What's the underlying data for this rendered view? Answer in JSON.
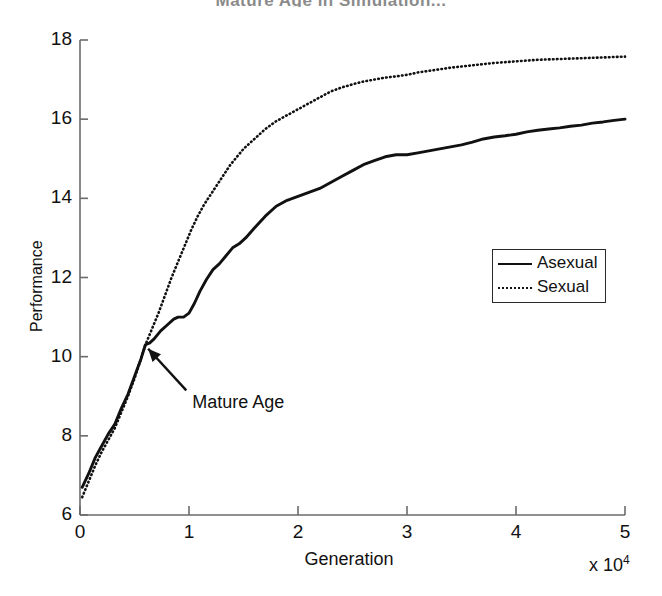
{
  "chart_data": {
    "type": "line",
    "title": "Mature Age in Simulation...",
    "xlabel": "Generation",
    "ylabel": "Performance",
    "x_multiplier": "x 10",
    "x_multiplier_exp": "4",
    "xlim": [
      0,
      5
    ],
    "ylim": [
      6,
      18
    ],
    "xticks": [
      0,
      1,
      2,
      3,
      4,
      5
    ],
    "yticks": [
      6,
      8,
      10,
      12,
      14,
      16,
      18
    ],
    "xtick_labels": [
      "0",
      "1",
      "2",
      "3",
      "4",
      "5"
    ],
    "ytick_labels": [
      "6",
      "8",
      "10",
      "12",
      "14",
      "16",
      "18"
    ],
    "grid": false,
    "legend_position": "center-right",
    "annotations": [
      {
        "text": "Mature Age",
        "point_x": 0.625,
        "point_y": 10.3,
        "label_x": 0.92,
        "label_y": 9.3
      }
    ],
    "series": [
      {
        "name": "Asexual",
        "style": "solid",
        "color": "#111111",
        "x": [
          0.02,
          0.08,
          0.14,
          0.2,
          0.26,
          0.32,
          0.38,
          0.44,
          0.5,
          0.56,
          0.6,
          0.64,
          0.68,
          0.74,
          0.8,
          0.86,
          0.9,
          0.95,
          1.0,
          1.05,
          1.1,
          1.16,
          1.22,
          1.28,
          1.34,
          1.4,
          1.46,
          1.52,
          1.6,
          1.7,
          1.8,
          1.9,
          2.0,
          2.1,
          2.2,
          2.3,
          2.4,
          2.5,
          2.6,
          2.7,
          2.8,
          2.9,
          3.0,
          3.1,
          3.2,
          3.3,
          3.4,
          3.5,
          3.6,
          3.7,
          3.8,
          3.9,
          4.0,
          4.1,
          4.2,
          4.3,
          4.4,
          4.5,
          4.6,
          4.7,
          4.8,
          4.9,
          5.0
        ],
        "y": [
          6.7,
          7.05,
          7.45,
          7.75,
          8.05,
          8.3,
          8.7,
          9.05,
          9.5,
          9.95,
          10.3,
          10.35,
          10.45,
          10.65,
          10.8,
          10.95,
          11.0,
          11.0,
          11.1,
          11.35,
          11.65,
          11.95,
          12.2,
          12.35,
          12.55,
          12.75,
          12.85,
          13.0,
          13.25,
          13.55,
          13.8,
          13.95,
          14.05,
          14.15,
          14.25,
          14.4,
          14.55,
          14.7,
          14.85,
          14.95,
          15.05,
          15.1,
          15.1,
          15.15,
          15.2,
          15.25,
          15.3,
          15.35,
          15.42,
          15.5,
          15.55,
          15.58,
          15.62,
          15.68,
          15.72,
          15.75,
          15.78,
          15.82,
          15.85,
          15.9,
          15.93,
          15.97,
          16.0
        ]
      },
      {
        "name": "Sexual",
        "style": "dotted",
        "color": "#111111",
        "x": [
          0.02,
          0.08,
          0.14,
          0.2,
          0.26,
          0.32,
          0.38,
          0.44,
          0.5,
          0.56,
          0.6,
          0.66,
          0.72,
          0.78,
          0.84,
          0.9,
          0.96,
          1.02,
          1.08,
          1.14,
          1.2,
          1.26,
          1.32,
          1.38,
          1.44,
          1.5,
          1.56,
          1.62,
          1.7,
          1.8,
          1.9,
          2.0,
          2.1,
          2.2,
          2.3,
          2.4,
          2.5,
          2.6,
          2.7,
          2.8,
          2.9,
          3.0,
          3.1,
          3.2,
          3.3,
          3.4,
          3.5,
          3.6,
          3.7,
          3.8,
          3.9,
          4.0,
          4.1,
          4.2,
          4.3,
          4.4,
          4.5,
          4.6,
          4.7,
          4.8,
          4.9,
          5.0
        ],
        "y": [
          6.45,
          6.85,
          7.25,
          7.6,
          7.9,
          8.2,
          8.6,
          9.0,
          9.45,
          9.95,
          10.3,
          10.7,
          11.1,
          11.55,
          12.0,
          12.4,
          12.8,
          13.2,
          13.55,
          13.85,
          14.1,
          14.35,
          14.6,
          14.85,
          15.05,
          15.25,
          15.4,
          15.55,
          15.75,
          15.95,
          16.1,
          16.25,
          16.4,
          16.55,
          16.7,
          16.8,
          16.88,
          16.95,
          17.0,
          17.05,
          17.08,
          17.12,
          17.18,
          17.22,
          17.26,
          17.3,
          17.33,
          17.36,
          17.39,
          17.42,
          17.44,
          17.46,
          17.48,
          17.5,
          17.51,
          17.52,
          17.53,
          17.54,
          17.55,
          17.56,
          17.57,
          17.58
        ]
      }
    ],
    "legend": [
      {
        "label": "Asexual",
        "style": "solid"
      },
      {
        "label": "Sexual",
        "style": "dotted"
      }
    ]
  }
}
